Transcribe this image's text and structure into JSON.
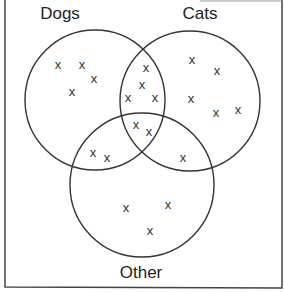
{
  "diagram": {
    "type": "venn",
    "sets": [
      {
        "name": "Dogs",
        "label": "Dogs",
        "cx": 95,
        "cy": 100,
        "r": 70,
        "label_x": 60,
        "label_y": 19
      },
      {
        "name": "Cats",
        "label": "Cats",
        "cx": 190,
        "cy": 101,
        "r": 70,
        "label_x": 200,
        "label_y": 19
      },
      {
        "name": "Other",
        "label": "Other",
        "cx": 142,
        "cy": 185,
        "r": 72,
        "label_x": 141,
        "label_y": 278
      }
    ],
    "marker": "x",
    "regions": [
      {
        "region": "Dogs only",
        "count": 4,
        "points": [
          [
            58,
            64
          ],
          [
            82,
            64
          ],
          [
            94,
            78
          ],
          [
            72,
            91
          ]
        ]
      },
      {
        "region": "Dogs and Cats only",
        "count": 4,
        "points": [
          [
            146,
            67
          ],
          [
            142,
            84
          ],
          [
            128,
            97
          ],
          [
            155,
            97
          ]
        ]
      },
      {
        "region": "Dogs, Cats and Other",
        "count": 2,
        "points": [
          [
            136,
            124
          ],
          [
            149,
            131
          ]
        ]
      },
      {
        "region": "Dogs and Other only",
        "count": 2,
        "points": [
          [
            93,
            152
          ],
          [
            107,
            157
          ]
        ]
      },
      {
        "region": "Cats only",
        "count": 5,
        "points": [
          [
            192,
            59
          ],
          [
            217,
            70
          ],
          [
            191,
            98
          ],
          [
            216,
            112
          ],
          [
            238,
            109
          ]
        ]
      },
      {
        "region": "Cats and Other only",
        "count": 1,
        "points": [
          [
            183,
            157
          ]
        ]
      },
      {
        "region": "Other only",
        "count": 3,
        "points": [
          [
            126,
            207
          ],
          [
            168,
            204
          ],
          [
            150,
            230
          ]
        ]
      }
    ],
    "colors": {
      "stroke": "#333333",
      "text": "#222222",
      "background": "#ffffff"
    }
  }
}
